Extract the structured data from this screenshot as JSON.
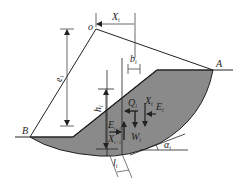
{
  "diagram": {
    "colors": {
      "soil_fill": "#8a8a8a",
      "line": "#222222",
      "dim_line": "#444444",
      "background": "#ffffff"
    },
    "points": {
      "center": {
        "label": "o"
      },
      "crest_end": {
        "label": "A"
      },
      "toe_end": {
        "label": "B"
      }
    },
    "dimensions": {
      "x": {
        "label": "X",
        "sub": "i"
      },
      "b": {
        "label": "b",
        "sub": "i"
      },
      "e": {
        "label": "e",
        "sub": "i"
      },
      "h": {
        "label": "h",
        "sub": "i"
      },
      "l": {
        "label": "l",
        "sub": "i"
      },
      "alpha": {
        "label": "α",
        "sub": "i"
      }
    },
    "forces": {
      "Q": {
        "label": "Q",
        "sub": "i"
      },
      "X_right": {
        "label": "X",
        "sub": "i"
      },
      "E_right": {
        "label": "E",
        "sub": "i"
      },
      "W": {
        "label": "W",
        "sub": "i"
      },
      "E_left": {
        "label": "E",
        "sub": "i+1"
      },
      "X_left": {
        "label": "X",
        "sub": "i+1"
      }
    }
  }
}
